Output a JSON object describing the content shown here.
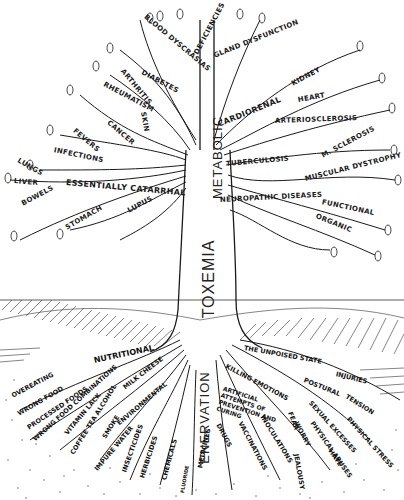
{
  "diagram": {
    "trunk": {
      "upper": "METABOLIC",
      "middle": "TOXEMIA",
      "lower": "ENERVATION"
    },
    "branches_left": [
      {
        "label": "BLOOD DYSCRASIAS"
      },
      {
        "label": "DIABETES"
      },
      {
        "label": "ARTHRITIS"
      },
      {
        "label": "RHEUMATISM"
      },
      {
        "label": "SKIN"
      },
      {
        "label": "CANCER"
      },
      {
        "label": "FEVERS"
      },
      {
        "label": "INFECTIONS"
      },
      {
        "label": "LUNGS"
      },
      {
        "label": "LIVER"
      },
      {
        "label": "BOWELS"
      },
      {
        "label": "ESSENTIALLY CATARRHAL"
      },
      {
        "label": "STOMACH"
      },
      {
        "label": "LUPUS"
      }
    ],
    "branches_right": [
      {
        "label": "DEFICIENCIES"
      },
      {
        "label": "GLAND DYSFUNCTION"
      },
      {
        "label": "KIDNEY"
      },
      {
        "label": "HEART"
      },
      {
        "label": "CARDIORENAL"
      },
      {
        "label": "ARTERIOSCLEROSIS"
      },
      {
        "label": "TUBERCULOSIS"
      },
      {
        "label": "M. SCLEROSIS"
      },
      {
        "label": "MUSCULAR DYSTROPHY"
      },
      {
        "label": "NEUROPATHIC DISEASES"
      },
      {
        "label": "FUNCTIONAL"
      },
      {
        "label": "ORGANIC"
      }
    ],
    "roots_left": [
      {
        "label": "NUTRITIONAL"
      },
      {
        "label": "OVEREATING"
      },
      {
        "label": "WRONG FOOD"
      },
      {
        "label": "PROCESSED FOODS"
      },
      {
        "label": "WRONG FOOD COMBINATIONS"
      },
      {
        "label": "VITAMIN LACK"
      },
      {
        "label": "COFFEE TEA ALCOHOL"
      },
      {
        "label": "MILK CHEESE"
      },
      {
        "label": "SMOKE"
      },
      {
        "label": "ENVIRONMENTAL"
      },
      {
        "label": "IMPURE WATER"
      },
      {
        "label": "INSECTICIDES"
      },
      {
        "label": "HERBICIDES"
      },
      {
        "label": "CHEMICALS"
      },
      {
        "label": "FLUORIDE"
      }
    ],
    "roots_right": [
      {
        "label": "THE UNPOISED STATE"
      },
      {
        "label": "INJURIES"
      },
      {
        "label": "POSTURAL"
      },
      {
        "label": "TENSION"
      },
      {
        "label": "PHYSICAL STRESS"
      },
      {
        "label": "KILLING EMOTIONS"
      },
      {
        "label": "SEXUAL EXCESSES"
      },
      {
        "label": "PHYSICAL ABUSES"
      },
      {
        "label": "WORRY"
      },
      {
        "label": "FEAR"
      },
      {
        "label": "HATE"
      },
      {
        "label": "JEALOUSY"
      },
      {
        "label": "ARTIFICIAL ATTEMPTS OF PREVENTION AND CURING"
      },
      {
        "label": "MEDICINES"
      },
      {
        "label": "DRUGS"
      },
      {
        "label": "VACCINATIONS"
      },
      {
        "label": "INOCULATIONS"
      }
    ],
    "colors": {
      "ink": "#1a1a1a",
      "paper": "#ffffff",
      "soil_dots": "#555555"
    }
  }
}
